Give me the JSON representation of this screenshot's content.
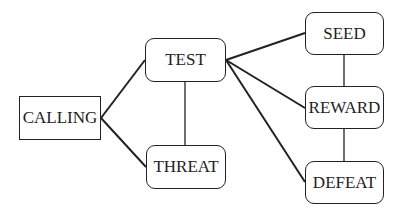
{
  "diagram": {
    "nodes": [
      {
        "id": "calling",
        "label": "CALLING",
        "shape": "rect",
        "x": 19,
        "y": 96,
        "w": 82,
        "h": 44
      },
      {
        "id": "test",
        "label": "TEST",
        "shape": "rounded",
        "x": 145,
        "y": 38,
        "w": 81,
        "h": 44
      },
      {
        "id": "threat",
        "label": "THREAT",
        "shape": "rounded",
        "x": 146,
        "y": 145,
        "w": 80,
        "h": 44
      },
      {
        "id": "seed",
        "label": "SEED",
        "shape": "rounded",
        "x": 305,
        "y": 12,
        "w": 79,
        "h": 43
      },
      {
        "id": "reward",
        "label": "REWARD",
        "shape": "rounded",
        "x": 305,
        "y": 86,
        "w": 79,
        "h": 43
      },
      {
        "id": "defeat",
        "label": "DEFEAT",
        "shape": "rounded",
        "x": 305,
        "y": 161,
        "w": 79,
        "h": 43
      }
    ],
    "edges": [
      {
        "from": "calling",
        "to": "test"
      },
      {
        "from": "calling",
        "to": "threat"
      },
      {
        "from": "test",
        "to": "threat"
      },
      {
        "from": "test",
        "to": "seed"
      },
      {
        "from": "test",
        "to": "reward"
      },
      {
        "from": "test",
        "to": "defeat"
      },
      {
        "from": "seed",
        "to": "reward"
      },
      {
        "from": "reward",
        "to": "defeat"
      }
    ],
    "colors": {
      "stroke": "#222222",
      "background": "#ffffff"
    }
  }
}
